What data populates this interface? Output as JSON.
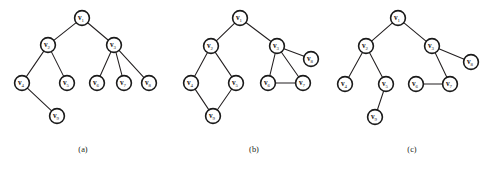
{
  "figure": {
    "background_color": "#ffffff",
    "node_fill_color": "#ffffff",
    "node_stroke_color": "#1a1a1a",
    "edge_color": "#231f20",
    "node_radius": 7.4
  },
  "panels": [
    {
      "id": "panel-a",
      "caption": "(a)",
      "caption_x": 83,
      "caption_y": 152,
      "nodes": [
        {
          "id": "a-v1",
          "label": "v",
          "subscript": "1",
          "x": 82,
          "y": 18
        },
        {
          "id": "a-v2",
          "label": "v",
          "subscript": "2",
          "x": 48,
          "y": 45
        },
        {
          "id": "a-v3",
          "label": "v",
          "subscript": "3",
          "x": 114,
          "y": 45
        },
        {
          "id": "a-v4",
          "label": "v",
          "subscript": "4",
          "x": 22,
          "y": 83
        },
        {
          "id": "a-v5",
          "label": "v",
          "subscript": "5",
          "x": 67,
          "y": 83
        },
        {
          "id": "a-v6",
          "label": "v",
          "subscript": "6",
          "x": 97,
          "y": 83
        },
        {
          "id": "a-v7",
          "label": "v",
          "subscript": "7",
          "x": 124,
          "y": 83
        },
        {
          "id": "a-v8",
          "label": "v",
          "subscript": "8",
          "x": 149,
          "y": 83
        },
        {
          "id": "a-v9",
          "label": "v",
          "subscript": "9",
          "x": 57,
          "y": 116
        }
      ],
      "edges": [
        {
          "from": "a-v1",
          "to": "a-v2"
        },
        {
          "from": "a-v1",
          "to": "a-v3"
        },
        {
          "from": "a-v2",
          "to": "a-v4"
        },
        {
          "from": "a-v2",
          "to": "a-v5"
        },
        {
          "from": "a-v3",
          "to": "a-v6"
        },
        {
          "from": "a-v3",
          "to": "a-v7"
        },
        {
          "from": "a-v3",
          "to": "a-v8"
        },
        {
          "from": "a-v4",
          "to": "a-v9"
        }
      ]
    },
    {
      "id": "panel-b",
      "caption": "(b)",
      "caption_x": 254,
      "caption_y": 152,
      "nodes": [
        {
          "id": "b-v1",
          "label": "v",
          "subscript": "1",
          "x": 240,
          "y": 18
        },
        {
          "id": "b-v2",
          "label": "v",
          "subscript": "2",
          "x": 211,
          "y": 46
        },
        {
          "id": "b-v3",
          "label": "v",
          "subscript": "3",
          "x": 277,
          "y": 46
        },
        {
          "id": "b-v4",
          "label": "v",
          "subscript": "4",
          "x": 191,
          "y": 83
        },
        {
          "id": "b-v5",
          "label": "v",
          "subscript": "5",
          "x": 236,
          "y": 83
        },
        {
          "id": "b-v6",
          "label": "v",
          "subscript": "6",
          "x": 268,
          "y": 83
        },
        {
          "id": "b-v7",
          "label": "v",
          "subscript": "7",
          "x": 303,
          "y": 83
        },
        {
          "id": "b-v8",
          "label": "v",
          "subscript": "8",
          "x": 311,
          "y": 59
        },
        {
          "id": "b-v9",
          "label": "v",
          "subscript": "9",
          "x": 213,
          "y": 116
        }
      ],
      "edges": [
        {
          "from": "b-v1",
          "to": "b-v2"
        },
        {
          "from": "b-v1",
          "to": "b-v3"
        },
        {
          "from": "b-v2",
          "to": "b-v4"
        },
        {
          "from": "b-v2",
          "to": "b-v5"
        },
        {
          "from": "b-v3",
          "to": "b-v8"
        },
        {
          "from": "b-v3",
          "to": "b-v6"
        },
        {
          "from": "b-v3",
          "to": "b-v7"
        },
        {
          "from": "b-v4",
          "to": "b-v9"
        },
        {
          "from": "b-v5",
          "to": "b-v9"
        },
        {
          "from": "b-v6",
          "to": "b-v7"
        }
      ]
    },
    {
      "id": "panel-c",
      "caption": "(c)",
      "caption_x": 412,
      "caption_y": 152,
      "nodes": [
        {
          "id": "c-v1",
          "label": "v",
          "subscript": "1",
          "x": 398,
          "y": 18
        },
        {
          "id": "c-v2",
          "label": "v",
          "subscript": "2",
          "x": 366,
          "y": 46
        },
        {
          "id": "c-v3",
          "label": "v",
          "subscript": "3",
          "x": 432,
          "y": 46
        },
        {
          "id": "c-v4",
          "label": "v",
          "subscript": "4",
          "x": 345,
          "y": 84
        },
        {
          "id": "c-v5",
          "label": "v",
          "subscript": "5",
          "x": 386,
          "y": 84
        },
        {
          "id": "c-v6",
          "label": "v",
          "subscript": "6",
          "x": 416,
          "y": 84
        },
        {
          "id": "c-v7",
          "label": "v",
          "subscript": "7",
          "x": 450,
          "y": 84
        },
        {
          "id": "c-v8",
          "label": "v",
          "subscript": "8",
          "x": 471,
          "y": 62
        },
        {
          "id": "c-v9",
          "label": "v",
          "subscript": "9",
          "x": 375,
          "y": 117
        }
      ],
      "edges": [
        {
          "from": "c-v1",
          "to": "c-v2"
        },
        {
          "from": "c-v1",
          "to": "c-v3"
        },
        {
          "from": "c-v2",
          "to": "c-v4"
        },
        {
          "from": "c-v2",
          "to": "c-v5"
        },
        {
          "from": "c-v3",
          "to": "c-v8"
        },
        {
          "from": "c-v3",
          "to": "c-v7"
        },
        {
          "from": "c-v5",
          "to": "c-v9"
        },
        {
          "from": "c-v6",
          "to": "c-v7"
        }
      ]
    }
  ]
}
